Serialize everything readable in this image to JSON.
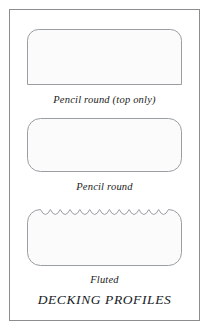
{
  "plate": {
    "title": "DECKING PROFILES",
    "border_color": "#8b8d90",
    "background_color": "#ffffff"
  },
  "style": {
    "shape_stroke_color": "#9a9da1",
    "shape_fill_color": "#fbfbfc",
    "caption_color": "#1c1c1c",
    "title_color": "#14181c"
  },
  "profiles": [
    {
      "id": "pencil-round-top-only",
      "caption": "Pencil round (top only)",
      "shape": "rounded-top-square-bottom",
      "corner_radius_top": 11,
      "corner_radius_bottom": 0,
      "width": 155,
      "height": 57
    },
    {
      "id": "pencil-round",
      "caption": "Pencil round",
      "shape": "rounded-all-corners",
      "corner_radius_top": 13,
      "corner_radius_bottom": 13,
      "width": 155,
      "height": 55
    },
    {
      "id": "fluted",
      "caption": "Fluted",
      "shape": "rounded-all-corners-scalloped-top",
      "corner_radius_top": 13,
      "corner_radius_bottom": 13,
      "width": 155,
      "height": 57,
      "scallop_count": 13,
      "scallop_depth": 5
    }
  ]
}
